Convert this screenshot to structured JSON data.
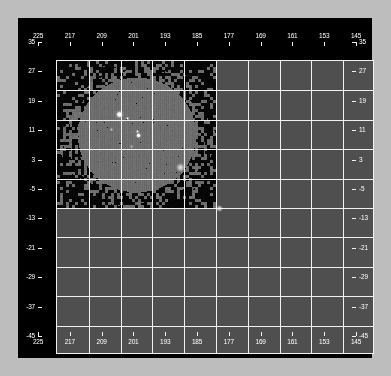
{
  "panel": {
    "background_color": "#000000",
    "frame_color": "#f2f2f2",
    "grid_color": "#f0f0f0",
    "label_color": "#ffffff"
  },
  "chart_data": {
    "type": "heatmap",
    "title": "",
    "subtitle": "",
    "xlabel": "",
    "ylabel": "",
    "grid": true,
    "legend": false,
    "colormap": "grayscale",
    "xlim": [
      225,
      145
    ],
    "ylim": [
      -45,
      35
    ],
    "x_ticks": [
      225,
      217,
      209,
      201,
      193,
      185,
      177,
      169,
      161,
      153,
      145
    ],
    "y_ticks": [
      35,
      27,
      19,
      11,
      3,
      -5,
      -13,
      -21,
      -29,
      -37,
      -45
    ],
    "x_tick_labels": [
      "225",
      "217",
      "209",
      "201",
      "193",
      "185",
      "177",
      "169",
      "161",
      "153",
      "145"
    ],
    "y_tick_labels": [
      "35",
      "27",
      "19",
      "11",
      "3",
      "-5",
      "-13",
      "-21",
      "-29",
      "-37",
      "-45"
    ],
    "x_tick_interval": 8,
    "y_tick_interval": 8,
    "axes_mirrored": true,
    "tick_positions": [
      "top",
      "bottom",
      "left",
      "right"
    ],
    "x_direction": "descending",
    "regions": [
      {
        "name": "inner-exposure",
        "fill": "#6e6e6e",
        "texture": "vertical-striping"
      },
      {
        "name": "outer-noise-border",
        "fill": "#000000",
        "texture": "blocky-mottled"
      }
    ],
    "sources": [
      {
        "name": "source-a",
        "x": 194,
        "y": 6,
        "brightness": 1.0,
        "size": "extended"
      },
      {
        "name": "source-a-companion",
        "x": 190,
        "y": 4,
        "brightness": 0.55,
        "size": "small"
      },
      {
        "name": "source-b",
        "x": 184,
        "y": -5,
        "brightness": 0.95,
        "size": "point"
      },
      {
        "name": "source-b-halo",
        "x": 185,
        "y": -3,
        "brightness": 0.5,
        "size": "small"
      },
      {
        "name": "source-c",
        "x": 188,
        "y": -11,
        "brightness": 0.3,
        "size": "faint"
      },
      {
        "name": "source-d",
        "x": 198,
        "y": -2,
        "brightness": 0.35,
        "size": "faint"
      }
    ]
  }
}
